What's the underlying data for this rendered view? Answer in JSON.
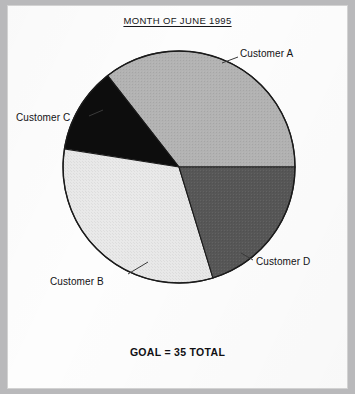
{
  "page": {
    "title": "MONTH OF JUNE 1995",
    "footer": "GOAL = 35 TOTAL"
  },
  "labels": {
    "customer_a": "Customer A",
    "customer_b": "Customer B",
    "customer_c": "Customer C",
    "customer_d": "Customer D"
  },
  "colors": {
    "customer_a": "#b3b3b3",
    "customer_b": "#e9e9e9",
    "customer_c": "#0d0d0d",
    "customer_d": "#575757",
    "outline": "#1b1b1b",
    "paper": "#fdfdfd",
    "background": "#b9b9bb",
    "text": "#121215"
  },
  "chart_data": {
    "type": "pie",
    "title": "MONTH OF JUNE 1995",
    "subtitle": "GOAL = 35 TOTAL",
    "total": 35,
    "units": "",
    "legend": "labels-on-slices",
    "start_angle_deg": 0,
    "direction": "counterclockwise",
    "categories": [
      "Customer A",
      "Customer C",
      "Customer B",
      "Customer D"
    ],
    "values": [
      12.5,
      4,
      11,
      7
    ],
    "percentages": [
      35.7,
      11.4,
      31.4,
      20.0
    ],
    "angles_deg": [
      128,
      43,
      116,
      73
    ],
    "slices": [
      {
        "name": "Customer A",
        "value": 12.5,
        "percent": 35.7,
        "angle_deg": 128,
        "start_deg": 0,
        "end_deg": 128,
        "color": "#b3b3b3",
        "label_position": "outside-right-top"
      },
      {
        "name": "Customer C",
        "value": 4,
        "percent": 11.4,
        "angle_deg": 43,
        "start_deg": 128,
        "end_deg": 171,
        "color": "#0d0d0d",
        "label_position": "outside-left"
      },
      {
        "name": "Customer B",
        "value": 11,
        "percent": 31.4,
        "angle_deg": 116,
        "start_deg": 171,
        "end_deg": 287,
        "color": "#e9e9e9",
        "label_position": "outside-left-bottom"
      },
      {
        "name": "Customer D",
        "value": 7,
        "percent": 20.0,
        "angle_deg": 73,
        "start_deg": 287,
        "end_deg": 360,
        "color": "#575757",
        "label_position": "outside-right-bottom"
      }
    ]
  }
}
